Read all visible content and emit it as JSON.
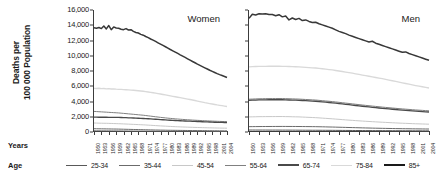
{
  "figure": {
    "ylabel_line1": "Deaths per",
    "ylabel_line2": "100 000 Population",
    "row_label_years": "Years",
    "row_label_age": "Age"
  },
  "chart_data": {
    "type": "line",
    "title": "",
    "xlabel": "Years",
    "ylabel": "Deaths per 100 000 Population",
    "ylim": [
      0,
      16000
    ],
    "ytick_labels": [
      "0",
      "2,000",
      "4,000",
      "6,000",
      "8,000",
      "10,000",
      "12,000",
      "14,000",
      "16,000"
    ],
    "ytick_values": [
      0,
      2000,
      4000,
      6000,
      8000,
      10000,
      12000,
      14000,
      16000
    ],
    "grid": false,
    "legend_position": "bottom",
    "xlim": [
      1950,
      2004
    ],
    "xtick_labels": [
      "1950",
      "1953",
      "1956",
      "1959",
      "1962",
      "1965",
      "1968",
      "1971",
      "1974",
      "1977",
      "1980",
      "1983",
      "1986",
      "1989",
      "1992",
      "1995",
      "1998",
      "2001",
      "2004"
    ],
    "x": [
      1950,
      1951,
      1952,
      1953,
      1954,
      1955,
      1956,
      1957,
      1958,
      1959,
      1960,
      1961,
      1962,
      1963,
      1964,
      1965,
      1966,
      1967,
      1968,
      1969,
      1970,
      1971,
      1972,
      1973,
      1974,
      1975,
      1976,
      1977,
      1978,
      1979,
      1980,
      1981,
      1982,
      1983,
      1984,
      1985,
      1986,
      1987,
      1988,
      1989,
      1990,
      1991,
      1992,
      1993,
      1994,
      1995,
      1996,
      1997,
      1998,
      1999,
      2000,
      2001,
      2002,
      2003,
      2004
    ],
    "panels": [
      {
        "name": "Women",
        "series": [
          {
            "name": "25-34",
            "color": "#595959",
            "width": 1.0,
            "values": [
              150,
              148,
              146,
              144,
              142,
              140,
              138,
              136,
              134,
              132,
              130,
              128,
              126,
              124,
              122,
              120,
              118,
              116,
              114,
              112,
              110,
              108,
              106,
              104,
              102,
              100,
              98,
              96,
              94,
              92,
              90,
              88,
              86,
              85,
              84,
              83,
              82,
              81,
              80,
              79,
              78,
              77,
              76,
              75,
              74,
              73,
              72,
              71,
              70,
              69,
              68,
              67,
              66,
              65,
              64
            ]
          },
          {
            "name": "35-44",
            "color": "#6b6b6b",
            "width": 1.0,
            "values": [
              430,
              425,
              420,
              415,
              410,
              405,
              400,
              395,
              390,
              385,
              380,
              372,
              364,
              356,
              348,
              340,
              332,
              324,
              316,
              308,
              300,
              292,
              284,
              276,
              268,
              260,
              254,
              248,
              242,
              236,
              230,
              226,
              222,
              218,
              214,
              210,
              206,
              202,
              198,
              194,
              190,
              187,
              184,
              181,
              178,
              175,
              172,
              169,
              166,
              163,
              160,
              158,
              156,
              154,
              152
            ]
          },
          {
            "name": "45-54",
            "color": "#c8c8c8",
            "width": 1.0,
            "values": [
              1180,
              1170,
              1160,
              1150,
              1145,
              1140,
              1130,
              1120,
              1110,
              1100,
              1090,
              1075,
              1060,
              1045,
              1030,
              1015,
              1000,
              985,
              970,
              955,
              940,
              920,
              900,
              880,
              860,
              840,
              820,
              800,
              782,
              764,
              746,
              730,
              714,
              700,
              686,
              672,
              660,
              648,
              636,
              624,
              612,
              602,
              592,
              582,
              572,
              562,
              554,
              546,
              538,
              530,
              522,
              516,
              510,
              504,
              498
            ]
          },
          {
            "name": "55-64",
            "color": "#808080",
            "width": 1.0,
            "values": [
              2700,
              2680,
              2660,
              2640,
              2620,
              2600,
              2580,
              2560,
              2540,
              2520,
              2500,
              2470,
              2440,
              2410,
              2380,
              2350,
              2320,
              2290,
              2260,
              2230,
              2200,
              2160,
              2120,
              2080,
              2040,
              2000,
              1960,
              1920,
              1885,
              1850,
              1815,
              1785,
              1755,
              1725,
              1700,
              1675,
              1650,
              1628,
              1606,
              1584,
              1562,
              1545,
              1528,
              1511,
              1494,
              1477,
              1462,
              1447,
              1432,
              1417,
              1402,
              1390,
              1378,
              1366,
              1354
            ]
          },
          {
            "name": "65-74",
            "color": "#4a4a4a",
            "width": 1.35,
            "values": [
              1950,
              1945,
              1940,
              1938,
              1935,
              1932,
              1928,
              1925,
              1920,
              1915,
              1910,
              1900,
              1888,
              1875,
              1862,
              1848,
              1835,
              1820,
              1805,
              1790,
              1775,
              1755,
              1735,
              1715,
              1695,
              1675,
              1650,
              1628,
              1606,
              1584,
              1562,
              1545,
              1528,
              1511,
              1494,
              1477,
              1462,
              1447,
              1432,
              1417,
              1402,
              1388,
              1374,
              1360,
              1346,
              1332,
              1320,
              1308,
              1296,
              1284,
              1272,
              1262,
              1252,
              1242,
              1232
            ]
          },
          {
            "name": "75-84",
            "color": "#d9d9d9",
            "width": 1.35,
            "values": [
              5720,
              5700,
              5740,
              5680,
              5700,
              5660,
              5680,
              5640,
              5660,
              5620,
              5600,
              5580,
              5560,
              5540,
              5520,
              5500,
              5470,
              5440,
              5410,
              5380,
              5350,
              5300,
              5250,
              5200,
              5150,
              5100,
              5040,
              4980,
              4920,
              4860,
              4800,
              4740,
              4680,
              4620,
              4560,
              4500,
              4440,
              4380,
              4320,
              4260,
              4200,
              4130,
              4060,
              3990,
              3920,
              3850,
              3790,
              3730,
              3670,
              3610,
              3550,
              3500,
              3450,
              3400,
              3350
            ]
          },
          {
            "name": "85+",
            "color": "#383838",
            "width": 1.5,
            "values": [
              13680,
              13620,
              13700,
              13560,
              13900,
              13520,
              13960,
              13420,
              13780,
              13640,
              13600,
              13480,
              13420,
              13560,
              13380,
              13420,
              13200,
              13050,
              12980,
              12800,
              12700,
              12520,
              12380,
              12200,
              12050,
              11880,
              11700,
              11520,
              11350,
              11180,
              11000,
              10820,
              10650,
              10480,
              10300,
              10120,
              9950,
              9780,
              9600,
              9420,
              9250,
              9080,
              8900,
              8740,
              8580,
              8420,
              8260,
              8100,
              7950,
              7800,
              7650,
              7520,
              7400,
              7280,
              7150
            ]
          }
        ]
      },
      {
        "name": "Men",
        "series": [
          {
            "name": "25-34",
            "color": "#595959",
            "width": 1.0,
            "values": [
              260,
              258,
              256,
              255,
              254,
              253,
              252,
              251,
              250,
              249,
              248,
              246,
              244,
              242,
              240,
              238,
              236,
              234,
              232,
              230,
              228,
              226,
              224,
              222,
              220,
              218,
              215,
              212,
              209,
              206,
              203,
              200,
              197,
              194,
              191,
              188,
              186,
              184,
              182,
              180,
              178,
              176,
              174,
              172,
              170,
              168,
              166,
              164,
              162,
              160,
              158,
              156,
              154,
              152,
              150
            ]
          },
          {
            "name": "35-44",
            "color": "#6b6b6b",
            "width": 1.0,
            "values": [
              700,
              705,
              710,
              715,
              718,
              720,
              722,
              724,
              726,
              728,
              730,
              728,
              726,
              724,
              722,
              720,
              716,
              712,
              708,
              704,
              700,
              690,
              680,
              670,
              660,
              650,
              638,
              626,
              614,
              602,
              590,
              578,
              566,
              554,
              542,
              530,
              520,
              510,
              500,
              490,
              480,
              472,
              464,
              456,
              448,
              440,
              434,
              428,
              422,
              416,
              410,
              405,
              400,
              395,
              390
            ]
          },
          {
            "name": "45-54",
            "color": "#c8c8c8",
            "width": 1.0,
            "values": [
              1980,
              1990,
              2000,
              2010,
              2015,
              2020,
              2022,
              2024,
              2026,
              2028,
              2030,
              2020,
              2010,
              2000,
              1990,
              1980,
              1960,
              1940,
              1920,
              1900,
              1880,
              1850,
              1820,
              1790,
              1760,
              1730,
              1695,
              1660,
              1625,
              1590,
              1555,
              1525,
              1495,
              1465,
              1435,
              1405,
              1380,
              1355,
              1330,
              1305,
              1280,
              1258,
              1236,
              1214,
              1192,
              1170,
              1152,
              1134,
              1116,
              1098,
              1080,
              1066,
              1052,
              1038,
              1024
            ]
          },
          {
            "name": "55-64",
            "color": "#808080",
            "width": 1.0,
            "values": [
              4300,
              4320,
              4340,
              4355,
              4365,
              4375,
              4380,
              4385,
              4388,
              4390,
              4390,
              4375,
              4360,
              4345,
              4330,
              4315,
              4290,
              4265,
              4240,
              4215,
              4190,
              4150,
              4110,
              4070,
              4030,
              3990,
              3940,
              3890,
              3840,
              3790,
              3740,
              3690,
              3640,
              3590,
              3540,
              3490,
              3445,
              3400,
              3355,
              3310,
              3265,
              3225,
              3185,
              3145,
              3105,
              3065,
              3030,
              2995,
              2960,
              2925,
              2890,
              2862,
              2834,
              2806,
              2778
            ]
          },
          {
            "name": "65-74",
            "color": "#4a4a4a",
            "width": 1.35,
            "values": [
              4150,
              4170,
              4190,
              4205,
              4215,
              4220,
              4225,
              4228,
              4230,
              4230,
              4228,
              4215,
              4200,
              4185,
              4170,
              4155,
              4130,
              4105,
              4080,
              4055,
              4030,
              3990,
              3950,
              3910,
              3870,
              3830,
              3780,
              3730,
              3680,
              3630,
              3580,
              3530,
              3480,
              3430,
              3380,
              3330,
              3285,
              3240,
              3195,
              3150,
              3105,
              3065,
              3025,
              2985,
              2945,
              2905,
              2870,
              2835,
              2800,
              2765,
              2730,
              2702,
              2674,
              2646,
              2618
            ]
          },
          {
            "name": "75-84",
            "color": "#d9d9d9",
            "width": 1.35,
            "values": [
              8550,
              8570,
              8590,
              8600,
              8610,
              8615,
              8618,
              8620,
              8620,
              8618,
              8615,
              8600,
              8585,
              8570,
              8555,
              8540,
              8510,
              8480,
              8450,
              8420,
              8390,
              8340,
              8290,
              8240,
              8190,
              8140,
              8070,
              8000,
              7930,
              7860,
              7790,
              7710,
              7630,
              7550,
              7470,
              7390,
              7310,
              7230,
              7150,
              7070,
              6990,
              6900,
              6810,
              6720,
              6630,
              6540,
              6450,
              6360,
              6270,
              6180,
              6090,
              6010,
              5930,
              5850,
              5770
            ]
          },
          {
            "name": "85+",
            "color": "#383838",
            "width": 1.5,
            "values": [
              14900,
              15450,
              15350,
              15500,
              15480,
              15520,
              15420,
              15400,
              15250,
              15380,
              15100,
              15200,
              14700,
              14950,
              14750,
              14900,
              14620,
              14700,
              14500,
              14350,
              14400,
              14200,
              14050,
              13900,
              13750,
              13600,
              13400,
              13200,
              13050,
              12900,
              12700,
              12550,
              12400,
              12250,
              12100,
              11950,
              11800,
              11900,
              11650,
              11500,
              11350,
              11200,
              11050,
              10900,
              10750,
              10600,
              10450,
              10500,
              10300,
              10150,
              10000,
              9850,
              9700,
              9550,
              9400
            ]
          }
        ]
      }
    ],
    "legend": [
      {
        "label": "25-34",
        "color": "#595959",
        "width": 1.2
      },
      {
        "label": "35-44",
        "color": "#6b6b6b",
        "width": 1.2
      },
      {
        "label": "45-54",
        "color": "#c8c8c8",
        "width": 1.2
      },
      {
        "label": "55-64",
        "color": "#808080",
        "width": 1.2
      },
      {
        "label": "65-74",
        "color": "#4a4a4a",
        "width": 2.0
      },
      {
        "label": "75-84",
        "color": "#d9d9d9",
        "width": 1.6
      },
      {
        "label": "85+",
        "color": "#1a1a1a",
        "width": 2.0
      }
    ]
  }
}
